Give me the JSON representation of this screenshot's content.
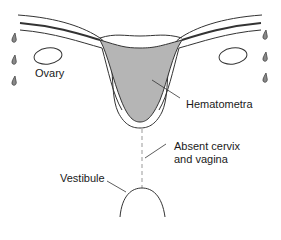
{
  "diagram": {
    "labels": {
      "ovary": "Ovary",
      "hematometra": "Hematometra",
      "absent_line1": "Absent cervix",
      "absent_line2": "and vagina",
      "vestibule": "Vestibule"
    },
    "colors": {
      "line": "#333333",
      "fill": "#b5b5b5",
      "dashed": "#999999"
    }
  }
}
